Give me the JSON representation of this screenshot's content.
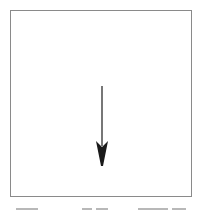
{
  "figure": {
    "frame": {
      "left": 10,
      "top": 10,
      "right": 192,
      "bottom": 197,
      "border_color": "#8a8a8a"
    },
    "arrow": {
      "direction": "down",
      "icon": "arrow-down-icon",
      "x": 102,
      "shaft_top": 86,
      "head_top": 140,
      "tip_y": 166,
      "head_left": 96,
      "head_right": 110,
      "color": "#1a1a1a"
    },
    "caption": {
      "visible_text": "",
      "truncated": true
    }
  }
}
